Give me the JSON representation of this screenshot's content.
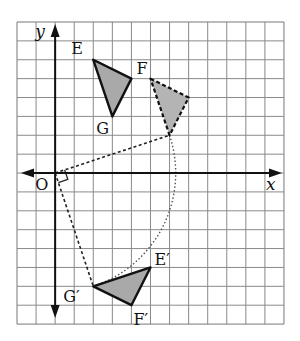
{
  "diagram": {
    "type": "coordinate-grid-rotation",
    "grid": {
      "columns": 14,
      "rows": 16,
      "left_px": 17,
      "top_px": 22,
      "cell_w_px": 19.07,
      "cell_h_px": 18.88,
      "origin_col": 2,
      "origin_row": 8,
      "line_color": "#8a8a8a",
      "border_color": "#777777"
    },
    "axes": {
      "x_label": "x",
      "y_label": "y",
      "origin_label": "O",
      "color": "#111111"
    },
    "triangles": [
      {
        "id": "EFG",
        "style": "solid",
        "fill": "#a9a9a9",
        "vertices": [
          {
            "name": "E",
            "label": "E",
            "x": 2,
            "y": 6,
            "label_dx": -22,
            "label_dy": -6
          },
          {
            "name": "F",
            "label": "F",
            "x": 4,
            "y": 5,
            "label_dx": 5,
            "label_dy": -5
          },
          {
            "name": "G",
            "label": "G",
            "x": 3,
            "y": 3,
            "label_dx": -16,
            "label_dy": 18
          }
        ]
      },
      {
        "id": "intermediate",
        "style": "dashed",
        "fill": "#b4b4b4",
        "vertices": [
          {
            "name": "P1",
            "label": "",
            "x": 5,
            "y": 5
          },
          {
            "name": "P2",
            "label": "",
            "x": 7,
            "y": 4
          },
          {
            "name": "P3",
            "label": "",
            "x": 6,
            "y": 2
          }
        ]
      },
      {
        "id": "E'F'G'",
        "style": "solid",
        "fill": "#a9a9a9",
        "vertices": [
          {
            "name": "E'",
            "label": "E′",
            "x": 5,
            "y": -5,
            "label_dx": 4,
            "label_dy": -2
          },
          {
            "name": "F'",
            "label": "F′",
            "x": 4,
            "y": -7,
            "label_dx": 2,
            "label_dy": 20
          },
          {
            "name": "G'",
            "label": "G′",
            "x": 2,
            "y": -6,
            "label_dx": -30,
            "label_dy": 16
          }
        ]
      }
    ],
    "construction": {
      "rotation_center": {
        "x": 0,
        "y": 0
      },
      "rotation_angle_deg": -90,
      "segments_dashed": [
        {
          "from": {
            "x": 0,
            "y": 0
          },
          "to": {
            "x": 6,
            "y": 2
          }
        },
        {
          "from": {
            "x": 0,
            "y": 0
          },
          "to": {
            "x": 2,
            "y": -6
          }
        }
      ],
      "arc_dotted": {
        "center": {
          "x": 0,
          "y": 0
        },
        "from": {
          "x": 6,
          "y": 2
        },
        "to": {
          "x": 2,
          "y": -6
        }
      },
      "segment_dotted_extra": {
        "from": {
          "x": 2,
          "y": -6
        },
        "to": {
          "x": 5,
          "y": -5
        }
      },
      "right_angle_marker": true
    }
  }
}
